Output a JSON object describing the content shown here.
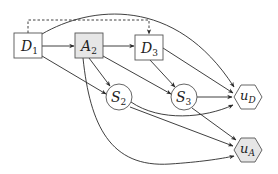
{
  "diagram": {
    "type": "influence-diagram",
    "colors": {
      "stroke": "#555555",
      "edge": "#2a2a2a",
      "decision_fill": "#ffffff",
      "highlight_fill": "#e6e6e6",
      "background": "#ffffff"
    },
    "nodes": [
      {
        "id": "D1",
        "base": "D",
        "sub": "1",
        "shape": "rect",
        "fill": "white"
      },
      {
        "id": "A2",
        "base": "A",
        "sub": "2",
        "shape": "rect",
        "fill": "gray"
      },
      {
        "id": "D3",
        "base": "D",
        "sub": "3",
        "shape": "rect",
        "fill": "white"
      },
      {
        "id": "S2",
        "base": "S",
        "sub": "2",
        "shape": "circle",
        "fill": "white"
      },
      {
        "id": "S3",
        "base": "S",
        "sub": "3",
        "shape": "circle",
        "fill": "white"
      },
      {
        "id": "uD",
        "base": "u",
        "sub": "D",
        "shape": "hexagon",
        "fill": "white"
      },
      {
        "id": "uA",
        "base": "u",
        "sub": "A",
        "shape": "hexagon",
        "fill": "gray"
      }
    ],
    "edges": [
      {
        "from": "D1",
        "to": "A2",
        "style": "solid"
      },
      {
        "from": "D1",
        "to": "D3",
        "style": "dashed"
      },
      {
        "from": "D1",
        "to": "uD",
        "style": "solid"
      },
      {
        "from": "D1",
        "to": "S2",
        "style": "solid"
      },
      {
        "from": "A2",
        "to": "D3",
        "style": "solid"
      },
      {
        "from": "A2",
        "to": "S2",
        "style": "solid"
      },
      {
        "from": "A2",
        "to": "S3",
        "style": "solid"
      },
      {
        "from": "A2",
        "to": "uA",
        "style": "solid"
      },
      {
        "from": "D3",
        "to": "S3",
        "style": "solid"
      },
      {
        "from": "D3",
        "to": "uD",
        "style": "solid"
      },
      {
        "from": "S2",
        "to": "uD",
        "style": "solid"
      },
      {
        "from": "S2",
        "to": "uA",
        "style": "solid"
      },
      {
        "from": "S3",
        "to": "uD",
        "style": "solid"
      },
      {
        "from": "S3",
        "to": "uA",
        "style": "solid"
      }
    ]
  }
}
